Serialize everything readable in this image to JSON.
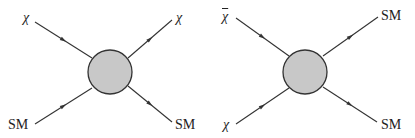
{
  "diagrams": [
    {
      "name": "scattering",
      "blob": {
        "cx": 110,
        "cy": 72,
        "r": 22,
        "fill": "#c8c8c8",
        "stroke": "#333333"
      },
      "legs": [
        {
          "label": "χ",
          "x1": 35,
          "y1": 22,
          "x2": 92,
          "y2": 58,
          "dir": "in"
        },
        {
          "label": "χ",
          "x1": 128,
          "y1": 58,
          "x2": 172,
          "y2": 20,
          "dir": "out"
        },
        {
          "label": "SM",
          "x1": 35,
          "y1": 124,
          "x2": 92,
          "y2": 88,
          "dir": "in"
        },
        {
          "label": "SM",
          "x1": 128,
          "y1": 86,
          "x2": 172,
          "y2": 122,
          "dir": "out"
        }
      ],
      "labels": [
        {
          "text": "χ",
          "x": 23,
          "y": 11,
          "greek": true,
          "bar": false
        },
        {
          "text": "χ",
          "x": 176,
          "y": 11,
          "greek": true,
          "bar": false
        },
        {
          "text": "SM",
          "x": 8,
          "y": 118,
          "greek": false,
          "bar": false
        },
        {
          "text": "SM",
          "x": 175,
          "y": 118,
          "greek": false,
          "bar": false
        }
      ]
    },
    {
      "name": "annihilation",
      "blob": {
        "cx": 305,
        "cy": 72,
        "r": 22,
        "fill": "#c8c8c8",
        "stroke": "#333333"
      },
      "legs": [
        {
          "label": "χ̄",
          "x1": 236,
          "y1": 18,
          "x2": 289,
          "y2": 56,
          "dir": "in"
        },
        {
          "label": "SM",
          "x1": 323,
          "y1": 56,
          "x2": 378,
          "y2": 17,
          "dir": "out"
        },
        {
          "label": "χ",
          "x1": 236,
          "y1": 124,
          "x2": 289,
          "y2": 88,
          "dir": "in"
        },
        {
          "label": "SM",
          "x1": 323,
          "y1": 87,
          "x2": 377,
          "y2": 122,
          "dir": "out"
        }
      ],
      "labels": [
        {
          "text": "χ",
          "x": 222,
          "y": 10,
          "greek": true,
          "bar": true
        },
        {
          "text": "SM",
          "x": 381,
          "y": 9,
          "greek": false,
          "bar": false
        },
        {
          "text": "χ",
          "x": 223,
          "y": 118,
          "greek": true,
          "bar": false
        },
        {
          "text": "SM",
          "x": 381,
          "y": 118,
          "greek": false,
          "bar": false
        }
      ]
    }
  ],
  "line_color": "#333333"
}
